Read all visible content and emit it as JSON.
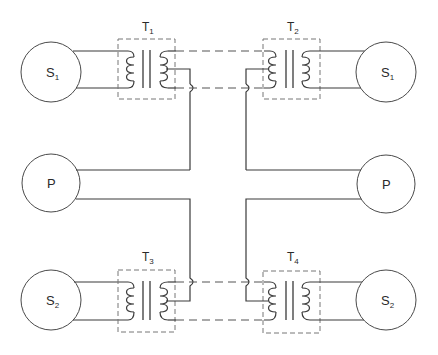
{
  "diagram": {
    "title": "",
    "sources": [
      {
        "id": "S1-left",
        "label": "S",
        "sub": "1"
      },
      {
        "id": "S1-right",
        "label": "S",
        "sub": "1"
      },
      {
        "id": "P-left",
        "label": "P",
        "sub": ""
      },
      {
        "id": "P-right",
        "label": "P",
        "sub": ""
      },
      {
        "id": "S2-left",
        "label": "S",
        "sub": "2"
      },
      {
        "id": "S2-right",
        "label": "S",
        "sub": "2"
      }
    ],
    "transformers": [
      {
        "id": "T1",
        "label": "T",
        "sub": "1"
      },
      {
        "id": "T2",
        "label": "T",
        "sub": "2"
      },
      {
        "id": "T3",
        "label": "T",
        "sub": "3"
      },
      {
        "id": "T4",
        "label": "T",
        "sub": "4"
      }
    ],
    "colors": {
      "background": "#ffffff",
      "line": "#3a3a3a",
      "box": "#777777"
    }
  }
}
